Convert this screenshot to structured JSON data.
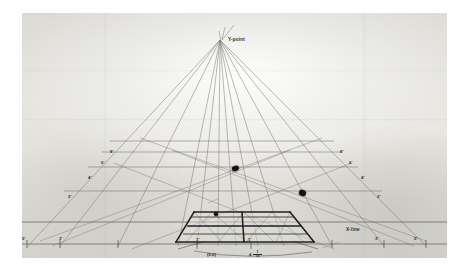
{
  "photo": {
    "subject": "hand-drawn one-point perspective grid on paper",
    "border_color": "#ffffff",
    "paper_color": "#e4e3de",
    "pencil_line_color": "#6d6b66",
    "dark_ink_color": "#231f1c"
  },
  "labels": {
    "vanishing_point": "Y-point",
    "horizon_line": "X-line",
    "origin": "(0,0)",
    "measure_whole": "4",
    "measure_numerator": "1",
    "measure_denominator": "16"
  },
  "baseline_ticks": [
    {
      "text": "5'",
      "x": 22,
      "y": 237
    },
    {
      "text": "3'",
      "x": 59,
      "y": 237
    },
    {
      "text": "1'",
      "x": 196,
      "y": 238
    },
    {
      "text": "1'",
      "x": 248,
      "y": 238
    },
    {
      "text": "3'",
      "x": 375,
      "y": 237
    },
    {
      "text": "5'",
      "x": 414,
      "y": 237
    }
  ],
  "left_diagonal_ticks": [
    {
      "text": "2'",
      "x": 68,
      "y": 195
    },
    {
      "text": "4'",
      "x": 88,
      "y": 176
    },
    {
      "text": "6'",
      "x": 101,
      "y": 161
    },
    {
      "text": "8'",
      "x": 110,
      "y": 150
    }
  ],
  "right_diagonal_ticks": [
    {
      "text": "2'",
      "x": 377,
      "y": 195
    },
    {
      "text": "4'",
      "x": 361,
      "y": 176
    },
    {
      "text": "6'",
      "x": 349,
      "y": 161
    },
    {
      "text": "8'",
      "x": 340,
      "y": 150
    }
  ],
  "chart_data": {
    "type": "diagram",
    "vanishing_point": {
      "label": "Y-point",
      "x": 219,
      "y": 38
    },
    "horizon": {
      "label": "X-line",
      "y": 231
    },
    "origin": {
      "label": "(0,0)",
      "x": 213,
      "y": 246
    },
    "ground_line_y": 246,
    "depth_gridlines_y": [
      152,
      166,
      183,
      207
    ],
    "depth_labels": [
      "8'",
      "6'",
      "4'",
      "2'"
    ],
    "baseline_labels": [
      "5'",
      "3'",
      "1'",
      "1'",
      "3'",
      "5'"
    ],
    "box": {
      "description": "dark drawn perspective floor grid, 2 rows x 3 columns with X diagonals",
      "rows": 2,
      "cols": 3
    },
    "ink_blobs": [
      {
        "x": 214,
        "y": 157,
        "r": 3.1
      },
      {
        "x": 281,
        "y": 181,
        "r": 3.3
      },
      {
        "x": 196,
        "y": 202,
        "r": 1.9
      }
    ]
  }
}
